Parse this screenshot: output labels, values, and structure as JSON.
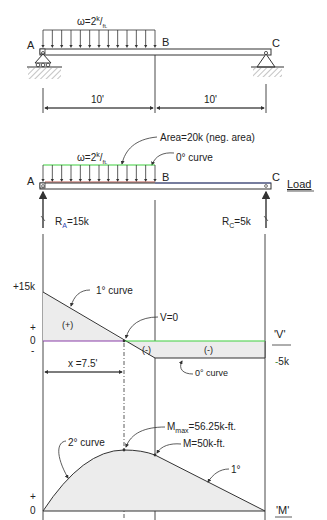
{
  "beam": {
    "load_label": "ω=2",
    "load_sup": "k",
    "load_sub": "ft.",
    "point_a": "A",
    "point_b": "B",
    "point_c": "C",
    "span_ab": "10'",
    "span_bc": "10'"
  },
  "load_diagram": {
    "area_note": "Area=20k (neg. area)",
    "curve_note": "0° curve",
    "title": "Load",
    "reaction_a": "R",
    "reaction_a_sub": "A",
    "reaction_a_value": "=15k",
    "reaction_c": "R",
    "reaction_c_sub": "C",
    "reaction_c_value": "=5k"
  },
  "shear_diagram": {
    "title": "'V'",
    "max_label": "+15k",
    "plus_sign": "+",
    "zero": "0",
    "minus_sign": "-",
    "min_label": "-5k",
    "curve_note": "1° curve",
    "zero_point_note": "V=0",
    "pos_region": "(+)",
    "neg_region_1": "(-)",
    "neg_region_2": "(-)",
    "x_dim": "x =7.5'",
    "flat_note": "0° curve"
  },
  "moment_diagram": {
    "title": "'M'",
    "plus_sign": "+",
    "zero": "0",
    "mmax_label": "M",
    "mmax_sub": "max",
    "mmax_value": "=56.25k-ft.",
    "mb_label": "M=50k-ft.",
    "curve_left_note": "2° curve",
    "curve_right_note": "1°"
  },
  "colors": {
    "line": "#333333",
    "fill": "#ececec",
    "green": "#3ecf3e",
    "purple": "#8a3fa8",
    "load_red": "#b8554a",
    "blue": "#2a3fb0",
    "minus5_green": "#3f8f3f"
  }
}
